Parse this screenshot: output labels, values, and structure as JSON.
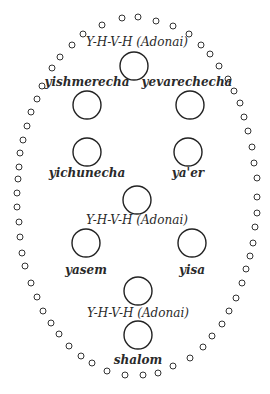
{
  "diagram": {
    "type": "priestly-blessing-layout",
    "ring_dot_radius": 3,
    "big_circle_radius": 14,
    "nodes": [
      {
        "id": "yhvh-1",
        "label": "Y-H-V-H (Adonai)",
        "label_pos": [
          137,
          46
        ],
        "circle": [
          134,
          66
        ],
        "bold": false
      },
      {
        "id": "yishmerecha",
        "label": "yishmerecha",
        "label_pos": [
          87,
          86
        ],
        "circle": [
          87,
          105
        ],
        "bold": true
      },
      {
        "id": "yevarechecha",
        "label": "yevarechecha",
        "label_pos": [
          187,
          86
        ],
        "circle": [
          190,
          105
        ],
        "bold": true
      },
      {
        "id": "yichunecha",
        "label": "yichunecha",
        "label_pos": [
          87,
          177
        ],
        "circle": [
          87,
          152
        ],
        "bold": true
      },
      {
        "id": "yaer",
        "label": "ya'er",
        "label_pos": [
          188,
          177
        ],
        "circle": [
          188,
          152
        ],
        "bold": true
      },
      {
        "id": "yhvh-2",
        "label": "Y-H-V-H (Adonai)",
        "label_pos": [
          137,
          224
        ],
        "circle": [
          137,
          200
        ],
        "bold": false
      },
      {
        "id": "yasem",
        "label": "yasem",
        "label_pos": [
          86,
          274
        ],
        "circle": [
          86,
          243
        ],
        "bold": true
      },
      {
        "id": "yisa",
        "label": "yisa",
        "label_pos": [
          192,
          274
        ],
        "circle": [
          192,
          243
        ],
        "bold": true
      },
      {
        "id": "yhvh-3",
        "label": "Y-H-V-H (Adonai)",
        "label_pos": [
          138,
          317
        ],
        "circle": [
          138,
          291
        ],
        "bold": false
      },
      {
        "id": "shalom",
        "label": "shalom",
        "label_pos": [
          138,
          364
        ],
        "circle": [
          138,
          335
        ],
        "bold": true
      }
    ],
    "ring_dots": [
      [
        122,
        18
      ],
      [
        138,
        17
      ],
      [
        156,
        21
      ],
      [
        173,
        26
      ],
      [
        189,
        34
      ],
      [
        201,
        45
      ],
      [
        210,
        54
      ],
      [
        219,
        66
      ],
      [
        228,
        79
      ],
      [
        234,
        91
      ],
      [
        240,
        103
      ],
      [
        244,
        117
      ],
      [
        248,
        131
      ],
      [
        252,
        147
      ],
      [
        254,
        163
      ],
      [
        257,
        178
      ],
      [
        257,
        197
      ],
      [
        257,
        213
      ],
      [
        255,
        227
      ],
      [
        253,
        243
      ],
      [
        250,
        256
      ],
      [
        246,
        269
      ],
      [
        242,
        283
      ],
      [
        236,
        298
      ],
      [
        229,
        311
      ],
      [
        222,
        324
      ],
      [
        212,
        336
      ],
      [
        203,
        347
      ],
      [
        190,
        358
      ],
      [
        173,
        366
      ],
      [
        158,
        373
      ],
      [
        143,
        375
      ],
      [
        125,
        375
      ],
      [
        107,
        371
      ],
      [
        92,
        363
      ],
      [
        81,
        356
      ],
      [
        69,
        346
      ],
      [
        59,
        334
      ],
      [
        51,
        323
      ],
      [
        43,
        311
      ],
      [
        37,
        297
      ],
      [
        31,
        283
      ],
      [
        25,
        266
      ],
      [
        22,
        253
      ],
      [
        20,
        237
      ],
      [
        19,
        222
      ],
      [
        17,
        207
      ],
      [
        17,
        193
      ],
      [
        18,
        179
      ],
      [
        19,
        167
      ],
      [
        20,
        153
      ],
      [
        23,
        140
      ],
      [
        27,
        126
      ],
      [
        31,
        112
      ],
      [
        37,
        99
      ],
      [
        42,
        86
      ],
      [
        52,
        68
      ],
      [
        60,
        57
      ],
      [
        72,
        45
      ],
      [
        83,
        34
      ],
      [
        102,
        25
      ]
    ]
  }
}
